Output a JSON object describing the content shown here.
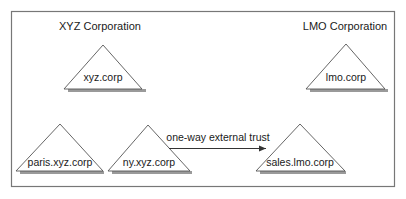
{
  "diagram": {
    "type": "active-directory-trust",
    "organizations": [
      {
        "id": "xyz",
        "label": "XYZ Corporation"
      },
      {
        "id": "lmo",
        "label": "LMO Corporation"
      }
    ],
    "domains": [
      {
        "id": "xyz-corp",
        "label": "xyz.corp",
        "organization": "xyz",
        "role": "forest-root"
      },
      {
        "id": "lmo-corp",
        "label": "lmo.corp",
        "organization": "lmo",
        "role": "forest-root"
      },
      {
        "id": "paris-xyz-corp",
        "label": "paris.xyz.corp",
        "organization": "xyz",
        "role": "child"
      },
      {
        "id": "ny-xyz-corp",
        "label": "ny.xyz.corp",
        "organization": "xyz",
        "role": "child"
      },
      {
        "id": "sales-lmo-corp",
        "label": "sales.lmo.corp",
        "organization": "lmo",
        "role": "child"
      }
    ],
    "trusts": [
      {
        "from": "ny-xyz-corp",
        "to": "sales-lmo-corp",
        "label": "one-way external trust",
        "direction": "one-way"
      }
    ],
    "colors": {
      "stroke": "#555555",
      "shadow": "#9a9a9a",
      "text": "#1a1a1a",
      "border": "#777777"
    }
  }
}
